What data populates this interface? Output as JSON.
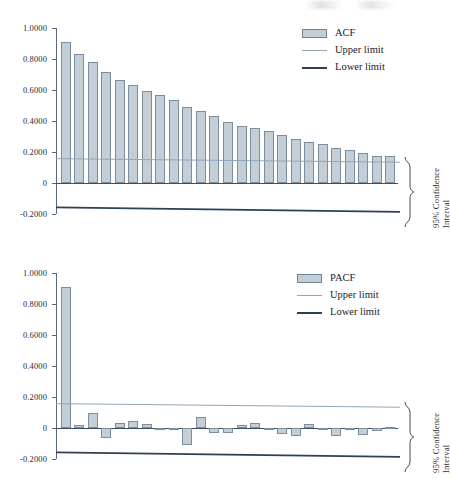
{
  "page": {
    "background": "#ffffff",
    "bar_fill": "#c3ced6",
    "bar_stroke": "#7a8ea0",
    "upper_limit_color": "#8fa6bb",
    "lower_limit_color": "#2e3f56",
    "axis_color": "#58697d"
  },
  "charts": [
    {
      "id": "acf",
      "legend": {
        "series_label": "ACF",
        "upper_label": "Upper limit",
        "lower_label": "Lower limit"
      },
      "ci_annotation": {
        "line1": "95% Confidence",
        "line2": "Interval"
      },
      "chart_data": {
        "type": "bar",
        "title": "",
        "subtitle": "",
        "xlabel": "",
        "ylabel": "",
        "grid": false,
        "legend_position": "top-right",
        "ylim": [
          -0.2,
          1.0
        ],
        "yticks": [
          1.0,
          0.8,
          0.6,
          0.4,
          0.2,
          0.0,
          -0.2
        ],
        "ytick_labels": [
          "1.0000",
          "0.8000",
          "0.6000",
          "0.4000",
          "0.2000",
          "0",
          "-0.2000"
        ],
        "categories": [
          1,
          2,
          3,
          4,
          5,
          6,
          7,
          8,
          9,
          10,
          11,
          12,
          13,
          14,
          15,
          16,
          17,
          18,
          19,
          20,
          21,
          22,
          23,
          24,
          25
        ],
        "series": [
          {
            "name": "ACF",
            "values": [
              0.91,
              0.835,
              0.783,
              0.718,
              0.665,
              0.63,
              0.596,
              0.565,
              0.533,
              0.49,
              0.462,
              0.433,
              0.395,
              0.37,
              0.353,
              0.336,
              0.312,
              0.286,
              0.266,
              0.252,
              0.228,
              0.211,
              0.193,
              0.176,
              0.175
            ]
          }
        ],
        "annotations": [
          {
            "name": "upper-limit",
            "type": "line",
            "y_start": 0.157,
            "y_end": 0.134,
            "label": "Upper limit"
          },
          {
            "name": "lower-limit",
            "type": "line",
            "y_start": -0.157,
            "y_end": -0.186,
            "label": "Lower limit"
          }
        ]
      }
    },
    {
      "id": "pacf",
      "legend": {
        "series_label": "PACF",
        "upper_label": "Upper limit",
        "lower_label": "Lower limit"
      },
      "ci_annotation": {
        "line1": "95% Confidence",
        "line2": "Interval"
      },
      "chart_data": {
        "type": "bar",
        "title": "",
        "subtitle": "",
        "xlabel": "",
        "ylabel": "",
        "grid": false,
        "legend_position": "top-right",
        "ylim": [
          -0.2,
          1.0
        ],
        "yticks": [
          1.0,
          0.8,
          0.6,
          0.4,
          0.2,
          0.0,
          -0.2
        ],
        "ytick_labels": [
          "1.0000",
          "0.8000",
          "0.6000",
          "0.4000",
          "0.2000",
          "0",
          "-0.2000"
        ],
        "categories": [
          1,
          2,
          3,
          4,
          5,
          6,
          7,
          8,
          9,
          10,
          11,
          12,
          13,
          14,
          15,
          16,
          17,
          18,
          19,
          20,
          21,
          22,
          23,
          24,
          25
        ],
        "series": [
          {
            "name": "PACF",
            "values": [
              0.91,
              0.022,
              0.097,
              -0.062,
              0.034,
              0.042,
              0.024,
              -0.007,
              -0.002,
              -0.107,
              0.07,
              -0.032,
              -0.034,
              0.019,
              0.033,
              -0.008,
              -0.037,
              -0.05,
              0.029,
              -0.012,
              -0.053,
              -0.011,
              -0.044,
              -0.02,
              0.004
            ]
          }
        ],
        "annotations": [
          {
            "name": "upper-limit",
            "type": "line",
            "y_start": 0.157,
            "y_end": 0.134,
            "label": "Upper limit"
          },
          {
            "name": "lower-limit",
            "type": "line",
            "y_start": -0.157,
            "y_end": -0.186,
            "label": "Lower limit"
          }
        ]
      }
    }
  ]
}
